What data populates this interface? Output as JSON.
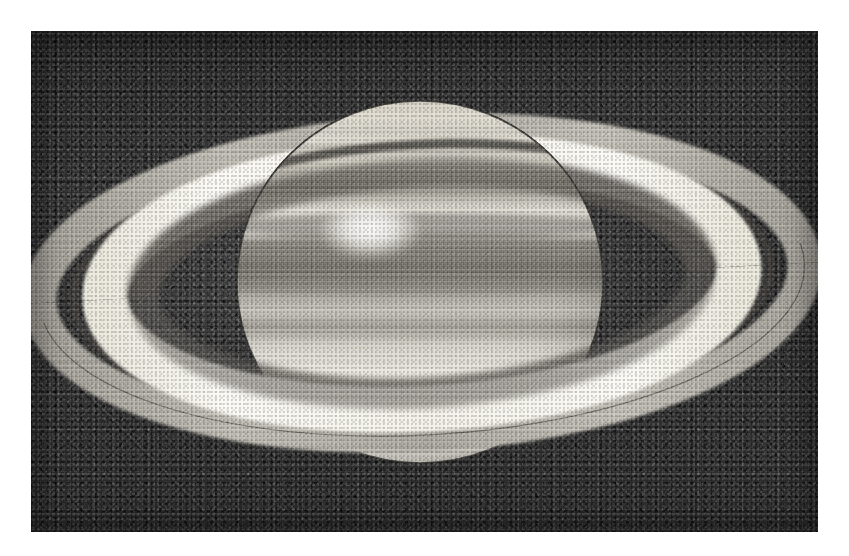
{
  "document": {
    "kind": "scanned-halftone-photograph",
    "subject": "Saturn",
    "orientation": "landscape"
  },
  "canvas": {
    "width": 849,
    "height": 556,
    "page_background": "#ffffff"
  },
  "plate": {
    "x": 31,
    "y": 31,
    "width": 787,
    "height": 501,
    "sky_color": "#3d3d3d",
    "grain": "heavy halftone / film grain"
  },
  "scene": {
    "title": "Saturn with rings",
    "center_x": 391,
    "center_y": 252,
    "ring_tilt_deg": -3,
    "illumination": "sunlit from above-left, rings tilted open toward viewer"
  },
  "planet": {
    "name": "Saturn disk",
    "center_x": 389,
    "center_y": 251,
    "radius_x": 183,
    "radius_y": 181,
    "body_color": "#e9e6dd",
    "north_polar_color": "#ded9cc",
    "equatorial_belt_color": "#8e8b83",
    "south_hemisphere_color": "#f1eee6",
    "bands": [
      {
        "name": "north-polar-hood",
        "y": 74,
        "height": 34,
        "tone": "#d6d1c3"
      },
      {
        "name": "north-temperate-belt",
        "y": 108,
        "height": 14,
        "tone": "#a9a59b"
      },
      {
        "name": "north-tropical-zone",
        "y": 148,
        "height": 22,
        "tone": "#eeebe3"
      },
      {
        "name": "north-equatorial-belt",
        "y": 182,
        "height": 30,
        "tone": "#7e7b74"
      },
      {
        "name": "equatorial-zone",
        "y": 214,
        "height": 26,
        "tone": "#cfccc3"
      },
      {
        "name": "south-equatorial-belt",
        "y": 240,
        "height": 22,
        "tone": "#8f8c84"
      },
      {
        "name": "south-tropical-zone",
        "y": 268,
        "height": 40,
        "tone": "#efece4"
      },
      {
        "name": "south-temperate-belt",
        "y": 312,
        "height": 16,
        "tone": "#bdb9b0"
      },
      {
        "name": "south-polar-region",
        "y": 340,
        "height": 70,
        "tone": "#f2efe7"
      }
    ]
  },
  "storm_spot": {
    "name": "bright equatorial storm",
    "center_x": 339,
    "center_y": 201,
    "radius_x": 48,
    "radius_y": 28,
    "tone": "#fbfaf6"
  },
  "rings": {
    "outer_radius_x": 383,
    "outer_radius_y": 152,
    "components": [
      {
        "name": "a-ring",
        "inner_pct": 78,
        "outer_pct": 100,
        "tone": "#b3b0a8",
        "label": "A Ring"
      },
      {
        "name": "cassini-division",
        "inner_pct": 74,
        "outer_pct": 78,
        "tone": "#3c3a36",
        "label": "Cassini Division"
      },
      {
        "name": "b-ring",
        "inner_pct": 52,
        "outer_pct": 74,
        "tone": "#f6f4ee",
        "label": "B Ring"
      },
      {
        "name": "c-ring",
        "inner_pct": 41,
        "outer_pct": 52,
        "tone": "#6a6761",
        "label": "C Ring (Crepe)"
      },
      {
        "name": "ring-gap-to-planet",
        "inner_pct": 0,
        "outer_pct": 41,
        "tone": "#2c2b29",
        "label": "inner gap"
      }
    ],
    "shadow_on_planet": {
      "name": "ring-shadow-band",
      "tone": "#5e5b55",
      "y": 152,
      "height": 26
    }
  },
  "labels": {
    "alt_text": "Black and white halftone photograph of the planet Saturn, its ring system tilted open, showing the Cassini Division, a bright B ring, dark banded cloud belts and a bright equatorial storm."
  }
}
